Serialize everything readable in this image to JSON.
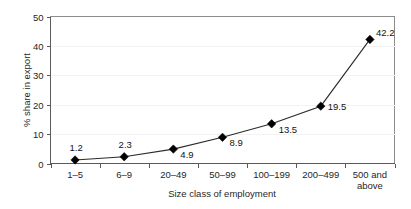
{
  "chart_data": {
    "type": "line",
    "title": "",
    "xlabel": "Size class of employment",
    "ylabel": "% share in export",
    "categories": [
      "1–5",
      "6–9",
      "20–49",
      "50–99",
      "100–199",
      "200–499",
      "500 and above"
    ],
    "values": [
      1.2,
      2.3,
      4.9,
      8.9,
      13.5,
      19.5,
      42.2
    ],
    "data_labels": [
      "1.2",
      "2.3",
      "4.9",
      "8.9",
      "13.5",
      "19.5",
      "42.2"
    ],
    "ylim": [
      0,
      50
    ],
    "yticks": [
      0,
      10,
      20,
      30,
      40,
      50
    ],
    "ytick_labels": [
      "0",
      "10",
      "20",
      "30",
      "40",
      "50"
    ],
    "grid": false,
    "legend": false,
    "marker": "diamond",
    "series": [
      {
        "name": "% share in export",
        "values": [
          1.2,
          2.3,
          4.9,
          8.9,
          13.5,
          19.5,
          42.2
        ],
        "color": "#000000"
      }
    ],
    "last_category_lines": [
      "500 and",
      "above"
    ]
  },
  "labels": {
    "y_axis_title": "% share in export",
    "x_axis_title": "Size class of employment"
  }
}
